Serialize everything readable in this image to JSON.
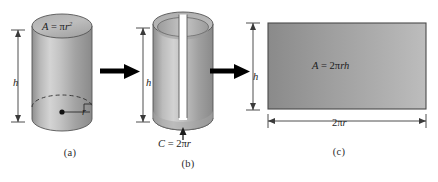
{
  "figure": {
    "colors": {
      "body_light": "#cfcfcf",
      "body_mid": "#a8a8a8",
      "body_dark": "#888888",
      "top_face": "#b4b4b4",
      "rect_dark": "#8c8c8c",
      "rect_light": "#b8b8b8",
      "outline": "#4a4a4a",
      "arrow": "#000000",
      "dimension_line": "#3a3a3a",
      "text": "#1c1c1c",
      "background": "#ffffff"
    }
  },
  "panel_a": {
    "caption": "(a)",
    "shape": "cylinder-closed",
    "area_label": {
      "lhs": "A",
      "eq": "=",
      "coef": "",
      "greek": "π",
      "var": "r",
      "exp": "2"
    },
    "height_label": "h",
    "radius_label": "r",
    "icons": {
      "center_dot": "center-point-dot",
      "right_angle": "right-angle-marker",
      "hidden_edge": "dashed-ellipse"
    }
  },
  "panel_b": {
    "caption": "(b)",
    "shape": "cylinder-slit-open",
    "height_label": "h",
    "circumference_label": {
      "lhs": "C",
      "eq": "=",
      "coef": "2",
      "greek": "π",
      "var": "r"
    },
    "icons": {
      "pointer": "up-arrow-pointer"
    }
  },
  "panel_c": {
    "caption": "(c)",
    "shape": "rectangle",
    "area_label": {
      "lhs": "A",
      "eq": "=",
      "coef": "2",
      "greek": "π",
      "var": "rh"
    },
    "height_label": "h",
    "width_label": {
      "coef": "2",
      "greek": "π",
      "var": "r"
    }
  },
  "transitions": [
    {
      "name": "arrow-a-to-b",
      "direction": "right"
    },
    {
      "name": "arrow-b-to-c",
      "direction": "right"
    }
  ]
}
